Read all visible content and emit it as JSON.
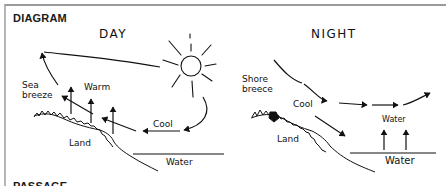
{
  "header": {
    "section_label": "DIAGRAM",
    "footer_label": "PASSAGE"
  },
  "panels": {
    "day": {
      "title": "DAY",
      "labels": {
        "sea_breeze_line1": "Sea",
        "sea_breeze_line2": "breeze",
        "warm": "Warm",
        "cool": "Cool",
        "land": "Land",
        "water": "Water"
      },
      "icons": [
        "sun-icon",
        "arrow-up-icon",
        "arrow-left-icon",
        "curved-arrow-icon"
      ]
    },
    "night": {
      "title": "NIGHT",
      "labels": {
        "shore_breeze_line1": "Shore",
        "shore_breeze_line2": "breece",
        "cool": "Cool",
        "land": "Land",
        "water_air": "Water",
        "water": "Water"
      },
      "icons": [
        "arrow-right-icon",
        "arrow-up-icon",
        "arrow-down-right-icon"
      ]
    }
  },
  "colors": {
    "ink": "#111111",
    "frame": "#9a9a9a",
    "background": "#ffffff"
  }
}
